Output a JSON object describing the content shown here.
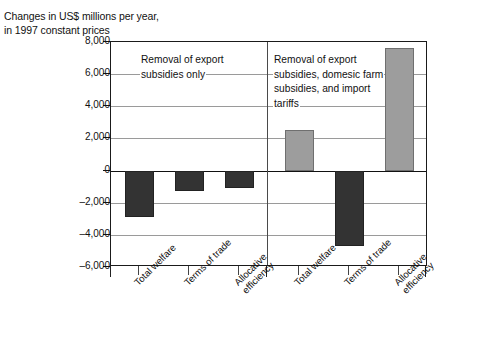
{
  "title": "Changes in US$ millions per year,\nin 1997 constant prices",
  "annotations": {
    "left": "Removal of export\nsubsidies only",
    "right": "Removal of export\nsubsidies, domesic farm\nsubsidies, and import\ntariffs"
  },
  "axis": {
    "ylabels": [
      "8,000",
      "6,000",
      "4,000",
      "2,000",
      "0",
      "–2,000",
      "–4,000",
      "–6,000"
    ],
    "yvalues": [
      8000,
      6000,
      4000,
      2000,
      0,
      -2000,
      -4000,
      -6000
    ]
  },
  "categories": [
    "Total welfare",
    "Terms of trade",
    "Allocative\nefficiency"
  ],
  "chart_data": {
    "type": "bar",
    "title": "Changes in US$ millions per year, in 1997 constant prices",
    "xlabel": "",
    "ylabel": "Changes in US$ millions per year, in 1997 constant prices",
    "ylim": [
      -6000,
      8000
    ],
    "ytick_values": [
      -6000,
      -4000,
      -2000,
      0,
      2000,
      4000,
      6000,
      8000
    ],
    "ytick_labels": [
      "–6,000",
      "–4,000",
      "–2,000",
      "0",
      "2,000",
      "4,000",
      "6,000",
      "8,000"
    ],
    "grid": true,
    "legend": "none",
    "panels": [
      {
        "name": "Removal of export subsidies only",
        "categories": [
          "Total welfare",
          "Terms of trade",
          "Allocative efficiency"
        ],
        "values": [
          -2900,
          -1300,
          -1100
        ],
        "colors": [
          "#333333",
          "#333333",
          "#333333"
        ]
      },
      {
        "name": "Removal of export subsidies, domesic farm subsidies, and import tariffs",
        "categories": [
          "Total welfare",
          "Terms of trade",
          "Allocative efficiency"
        ],
        "values": [
          2500,
          -4700,
          7600
        ],
        "colors": [
          "#9d9d9d",
          "#333333",
          "#9d9d9d"
        ]
      }
    ]
  },
  "colors": {
    "bar_dark": "#333333",
    "bar_light": "#9d9d9d",
    "grid": "#9a9a9a",
    "frame": "#1a1a1a",
    "text": "#111111"
  }
}
